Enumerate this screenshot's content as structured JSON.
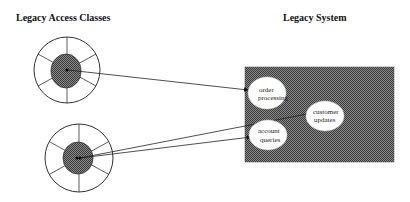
{
  "titles": {
    "left": "Legacy Access Classes",
    "right": "Legacy System"
  },
  "legacy_system": {
    "box_color": "#6e6e6e",
    "processes": [
      {
        "line1": "order",
        "line2": "processing"
      },
      {
        "line1": "customer",
        "line2": "updates"
      },
      {
        "line1": "account",
        "line2": "queries"
      }
    ]
  },
  "access_classes": [
    {
      "name": "access-class-top",
      "segments": 8
    },
    {
      "name": "access-class-bottom",
      "segments": 8
    }
  ],
  "connections": [
    {
      "from": "access-class-top",
      "to": "order processing"
    },
    {
      "from": "access-class-bottom",
      "to": "customer updates"
    },
    {
      "from": "access-class-bottom",
      "to": "account queries"
    }
  ]
}
